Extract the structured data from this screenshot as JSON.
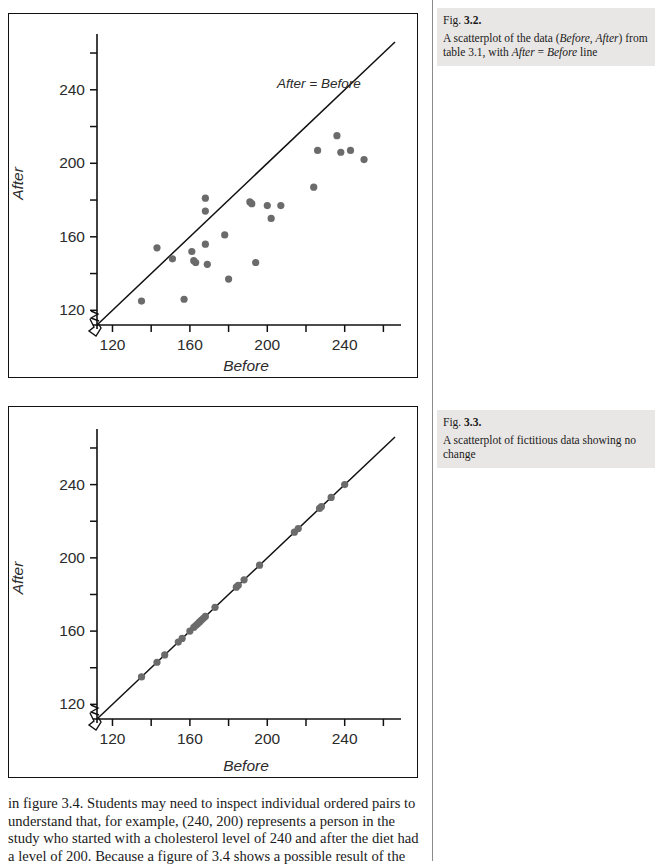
{
  "figures": [
    {
      "id": "fig-3-2",
      "caption": {
        "prefix": "Fig. ",
        "number": "3.2.",
        "body_part1": "A scatterplot of the data (",
        "body_em1": "Before",
        "body_part2": ", ",
        "body_em2": "After",
        "body_part3": ") from table 3.1, with ",
        "body_em3": "After",
        "body_part4": " = ",
        "body_em4": "Before",
        "body_part5": " line"
      }
    },
    {
      "id": "fig-3-3",
      "caption": {
        "prefix": "Fig. ",
        "number": "3.3.",
        "body_part1": "A scatterplot of fictitious data showing no change"
      }
    }
  ],
  "body_text": {
    "line1": "in figure 3.4. Students may need to inspect individual ordered pairs to",
    "line2": "understand that, for example, (240, 200) represents a person in the",
    "line3": "study who started with a cholesterol level of 240 and after the diet had",
    "line4": "a level of 200. Because a figure of 3.4 shows a possible result of the"
  },
  "chart_data": [
    {
      "type": "scatter",
      "title": "",
      "xlabel": "Before",
      "ylabel": "After",
      "xlim": [
        112,
        266
      ],
      "ylim": [
        112,
        266
      ],
      "xticks": [
        120,
        140,
        160,
        180,
        200,
        220,
        240,
        260
      ],
      "yticks": [
        120,
        140,
        160,
        180,
        200,
        220,
        240,
        260
      ],
      "xtick_labels": [
        "120",
        "",
        "160",
        "",
        "200",
        "",
        "240",
        ""
      ],
      "ytick_labels": [
        "120",
        "",
        "160",
        "",
        "200",
        "",
        "240",
        ""
      ],
      "grid": false,
      "axis_break": true,
      "reference_line": {
        "label": "After  =  Before",
        "slope": 1,
        "intercept": 0
      },
      "point_color": "#6b6b6b",
      "point_radius": 3.6,
      "points": [
        [
          135,
          125
        ],
        [
          143,
          154
        ],
        [
          151,
          148
        ],
        [
          157,
          126
        ],
        [
          161,
          152
        ],
        [
          162,
          147
        ],
        [
          163,
          146
        ],
        [
          168,
          181
        ],
        [
          168,
          174
        ],
        [
          168,
          156
        ],
        [
          169,
          145
        ],
        [
          178,
          161
        ],
        [
          180,
          137
        ],
        [
          191,
          179
        ],
        [
          192,
          178
        ],
        [
          194,
          146
        ],
        [
          200,
          177
        ],
        [
          202,
          170
        ],
        [
          207,
          177
        ],
        [
          224,
          187
        ],
        [
          226,
          207
        ],
        [
          236,
          215
        ],
        [
          238,
          206
        ],
        [
          243,
          207
        ],
        [
          250,
          202
        ]
      ]
    },
    {
      "type": "scatter",
      "title": "",
      "xlabel": "Before",
      "ylabel": "After",
      "xlim": [
        112,
        266
      ],
      "ylim": [
        112,
        266
      ],
      "xticks": [
        120,
        140,
        160,
        180,
        200,
        220,
        240,
        260
      ],
      "yticks": [
        120,
        140,
        160,
        180,
        200,
        220,
        240,
        260
      ],
      "xtick_labels": [
        "120",
        "",
        "160",
        "",
        "200",
        "",
        "240",
        ""
      ],
      "ytick_labels": [
        "120",
        "",
        "160",
        "",
        "200",
        "",
        "240",
        ""
      ],
      "grid": false,
      "axis_break": true,
      "reference_line": {
        "label": "",
        "slope": 1,
        "intercept": 0
      },
      "point_color": "#6b6b6b",
      "point_radius": 3.6,
      "points": [
        [
          135,
          135
        ],
        [
          143,
          143
        ],
        [
          147,
          147
        ],
        [
          154,
          154
        ],
        [
          156,
          156
        ],
        [
          160,
          160
        ],
        [
          162,
          162
        ],
        [
          163,
          163
        ],
        [
          164,
          164
        ],
        [
          165,
          165
        ],
        [
          166,
          166
        ],
        [
          167,
          167
        ],
        [
          168,
          168
        ],
        [
          173,
          173
        ],
        [
          184,
          184
        ],
        [
          185,
          185
        ],
        [
          188,
          188
        ],
        [
          196,
          196
        ],
        [
          214,
          214
        ],
        [
          216,
          216
        ],
        [
          227,
          227
        ],
        [
          228,
          228
        ],
        [
          233,
          233
        ],
        [
          240,
          240
        ]
      ]
    }
  ]
}
